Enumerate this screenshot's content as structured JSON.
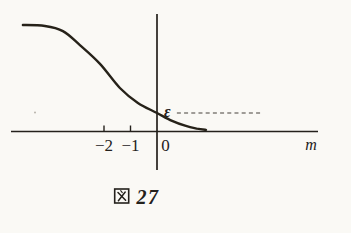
{
  "figure": {
    "caption": {
      "label": "図 27",
      "kanji": "図",
      "number": "27"
    },
    "axis": {
      "x_label": "m",
      "tick_labels": [
        "−2",
        "−1",
        "0"
      ]
    },
    "epsilon_label": "ε"
  },
  "colors": {
    "ink": "#24211c",
    "paper": "#faf9f5",
    "dash_gray": "#45413a"
  },
  "layout_transform": {
    "origin_x_px": 157,
    "origin_y_px": 131.5,
    "px_per_unit": 26.5
  },
  "chart_data": {
    "type": "line",
    "xlabel": "m",
    "ylabel": "",
    "xlim": [
      -5.5,
      6.1
    ],
    "ylim": [
      0,
      4.3
    ],
    "grid": false,
    "legend": null,
    "x_ticks": [
      -2,
      -1,
      0
    ],
    "series": [
      {
        "name": "decreasing-sigmoid-curve",
        "x": [
          -5.06,
          -4.23,
          -3.55,
          -2.91,
          -2.15,
          -1.4,
          -0.72,
          0,
          0.57,
          1.09,
          1.51,
          1.85
        ],
        "y": [
          4.02,
          3.98,
          3.79,
          3.26,
          2.55,
          1.64,
          1.08,
          0.7,
          0.4,
          0.21,
          0.11,
          0.06
        ]
      }
    ],
    "annotations": [
      {
        "type": "dashed-horizontal-line",
        "label": "ε",
        "y": 0.7,
        "x_start": 0.75,
        "x_end": 3.95
      }
    ]
  }
}
